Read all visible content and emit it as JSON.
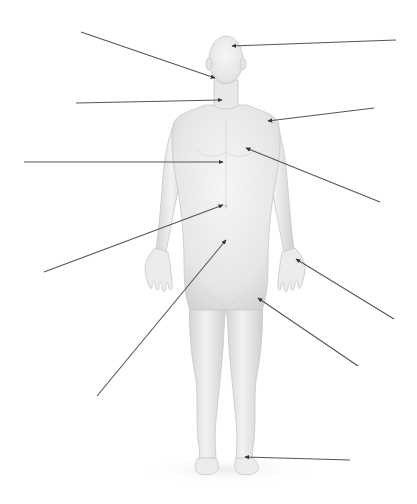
{
  "diagram": {
    "type": "anatomical-labeling-diagram",
    "background_color": "#ffffff",
    "skin_color": "#ececec",
    "skin_shadow_color": "#cfcfcf",
    "line_color": "#555555",
    "title_fragment": "",
    "leader_lines": [
      {
        "id": "head-top",
        "side": "right",
        "x1": 396,
        "y1": 40,
        "x2": 232,
        "y2": 46,
        "target": "cranial region"
      },
      {
        "id": "face",
        "side": "left",
        "x1": 81,
        "y1": 32,
        "x2": 215,
        "y2": 78,
        "target": "buccal / oral region"
      },
      {
        "id": "neck",
        "side": "left",
        "x1": 76,
        "y1": 103,
        "x2": 222,
        "y2": 100,
        "target": "cervical region"
      },
      {
        "id": "shoulder",
        "side": "right",
        "x1": 374,
        "y1": 108,
        "x2": 268,
        "y2": 121,
        "target": "acromial / deltoid region"
      },
      {
        "id": "sternum",
        "side": "left",
        "x1": 24,
        "y1": 162,
        "x2": 223,
        "y2": 162,
        "target": "sternal region"
      },
      {
        "id": "chest",
        "side": "right",
        "x1": 380,
        "y1": 202,
        "x2": 246,
        "y2": 148,
        "target": "thoracic / pectoral region"
      },
      {
        "id": "navel",
        "side": "left",
        "x1": 44,
        "y1": 272,
        "x2": 223,
        "y2": 205,
        "target": "umbilical region"
      },
      {
        "id": "pelvis",
        "side": "left",
        "x1": 97,
        "y1": 396,
        "x2": 226,
        "y2": 240,
        "target": "pubic / inguinal region"
      },
      {
        "id": "palm",
        "side": "right",
        "x1": 394,
        "y1": 319,
        "x2": 296,
        "y2": 259,
        "target": "palmar region"
      },
      {
        "id": "thigh",
        "side": "right",
        "x1": 358,
        "y1": 366,
        "x2": 258,
        "y2": 298,
        "target": "femoral region"
      },
      {
        "id": "foot",
        "side": "right",
        "x1": 350,
        "y1": 460,
        "x2": 245,
        "y2": 457,
        "target": "tarsal / dorsum of foot"
      }
    ],
    "labels": []
  }
}
